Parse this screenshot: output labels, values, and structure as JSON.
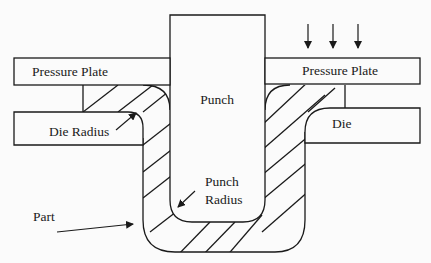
{
  "diagram": {
    "title": "",
    "labels": {
      "pressure_plate_left": "Pressure Plate",
      "pressure_plate_right": "Pressure Plate",
      "punch": "Punch",
      "die_radius": "Die Radius",
      "die": "Die",
      "punch_radius_line1": "Punch",
      "punch_radius_line2": "Radius",
      "part": "Part"
    },
    "force_arrows": 3,
    "colors": {
      "stroke": "#1a1a1a",
      "background": "#fbfbfb"
    }
  }
}
